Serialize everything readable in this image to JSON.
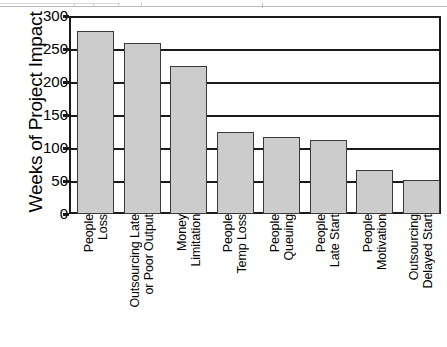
{
  "chart_data": {
    "type": "bar",
    "title": "",
    "xlabel": "",
    "ylabel": "Weeks of Project Impact",
    "ylim": [
      0,
      300
    ],
    "ytick_step": 50,
    "yticks": [
      300,
      250,
      200,
      150,
      100,
      50,
      0
    ],
    "grid": "horizontal",
    "legend": "none",
    "orientation": "vertical",
    "categories": [
      "People Loss",
      "Outsourcing Late or Poor Output",
      "Money Limitation",
      "People Temp Loss",
      "People Queuing",
      "People Late Start",
      "People Motivation",
      "Outsourcing Delayed Start"
    ],
    "category_label_lines": [
      [
        "People",
        "Loss"
      ],
      [
        "Outsourcing Late",
        "or Poor Output"
      ],
      [
        "Money",
        "Limitation"
      ],
      [
        "People",
        "Temp Loss"
      ],
      [
        "People",
        "Queuing"
      ],
      [
        "People",
        "Late Start"
      ],
      [
        "People",
        "Motivation"
      ],
      [
        "Outsourcing",
        "Delayed Start"
      ]
    ],
    "values": [
      277,
      259,
      225,
      125,
      116,
      112,
      67,
      52
    ],
    "bar_fill": "#cccccc",
    "bar_stroke": "#3a3a3a",
    "axis_color": "#1a1a1a"
  }
}
